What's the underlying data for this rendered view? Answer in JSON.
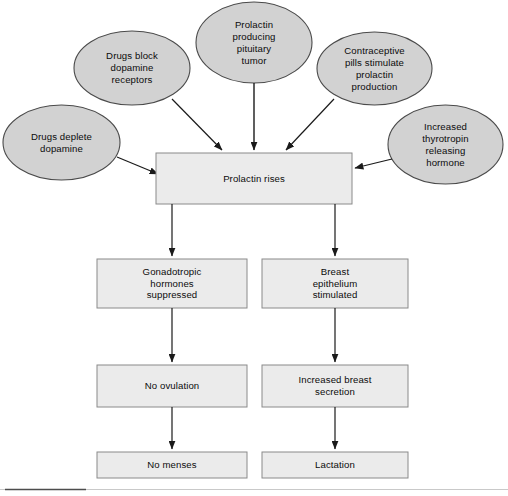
{
  "diagram": {
    "colors": {
      "ellipse_fill": "#d2d2d2",
      "ellipse_stroke": "#4a4a4a",
      "box_fill": "#ebebeb",
      "box_stroke": "#8a8a8a",
      "arrow": "#1a1a1a",
      "background": "#ffffff",
      "rule_dark": "#4d4d4d",
      "rule_light": "#c9c9c9"
    },
    "causes": [
      {
        "id": "drugs-deplete-dopamine",
        "label": "Drugs deplete\ndopamine",
        "shape": "ellipse",
        "cx": 61.5,
        "cy": 142.5,
        "rx": 58.5,
        "ry": 37.5
      },
      {
        "id": "drugs-block-dopamine-receptors",
        "label": "Drugs block\ndopamine\nreceptors",
        "shape": "ellipse",
        "cx": 132,
        "cy": 68,
        "rx": 58,
        "ry": 37
      },
      {
        "id": "prolactin-producing-pituitary-tumor",
        "label": "Prolactin\nproducing\npituitary\ntumor",
        "shape": "ellipse",
        "cx": 254,
        "cy": 42.5,
        "rx": 58,
        "ry": 40.5
      },
      {
        "id": "contraceptive-pills",
        "label": "Contraceptive\npills stimulate\nprolactin\nproduction",
        "shape": "ellipse",
        "cx": 374.5,
        "cy": 68.5,
        "rx": 57.5,
        "ry": 36.5
      },
      {
        "id": "increased-thyrotropin-releasing-hormone",
        "label": "Increased\nthyrotropin\nreleasing\nhormone",
        "shape": "ellipse",
        "cx": 445.5,
        "cy": 144.5,
        "rx": 57.5,
        "ry": 39.5
      }
    ],
    "central": {
      "id": "prolactin-rises",
      "label": "Prolactin rises",
      "shape": "rect",
      "x": 156,
      "y": 153,
      "w": 196,
      "h": 51
    },
    "left_chain": [
      {
        "id": "gonadotropic-hormones-suppressed",
        "label": "Gonadotropic\nhormones\nsuppressed",
        "shape": "rect",
        "x": 97,
        "y": 259,
        "w": 150,
        "h": 49
      },
      {
        "id": "no-ovulation",
        "label": "No ovulation",
        "shape": "rect",
        "x": 97,
        "y": 365,
        "w": 150,
        "h": 42
      },
      {
        "id": "no-menses",
        "label": "No menses",
        "shape": "rect",
        "x": 97,
        "y": 452,
        "w": 150,
        "h": 26
      }
    ],
    "right_chain": [
      {
        "id": "breast-epithelium-stimulated",
        "label": "Breast\nepithelium\nstimulated",
        "shape": "rect",
        "x": 262,
        "y": 259,
        "w": 146,
        "h": 49
      },
      {
        "id": "increased-breast-secretion",
        "label": "Increased breast\nsecretion",
        "shape": "rect",
        "x": 262,
        "y": 365,
        "w": 146,
        "h": 42
      },
      {
        "id": "lactation",
        "label": "Lactation",
        "shape": "rect",
        "x": 262,
        "y": 452,
        "w": 146,
        "h": 26
      }
    ],
    "connections": [
      {
        "from": "drugs-deplete-dopamine",
        "to": "prolactin-rises"
      },
      {
        "from": "drugs-block-dopamine-receptors",
        "to": "prolactin-rises"
      },
      {
        "from": "prolactin-producing-pituitary-tumor",
        "to": "prolactin-rises"
      },
      {
        "from": "contraceptive-pills",
        "to": "prolactin-rises"
      },
      {
        "from": "increased-thyrotropin-releasing-hormone",
        "to": "prolactin-rises"
      },
      {
        "from": "prolactin-rises",
        "to": "gonadotropic-hormones-suppressed"
      },
      {
        "from": "prolactin-rises",
        "to": "breast-epithelium-stimulated"
      },
      {
        "from": "gonadotropic-hormones-suppressed",
        "to": "no-ovulation"
      },
      {
        "from": "no-ovulation",
        "to": "no-menses"
      },
      {
        "from": "breast-epithelium-stimulated",
        "to": "increased-breast-secretion"
      },
      {
        "from": "increased-breast-secretion",
        "to": "lactation"
      }
    ]
  }
}
